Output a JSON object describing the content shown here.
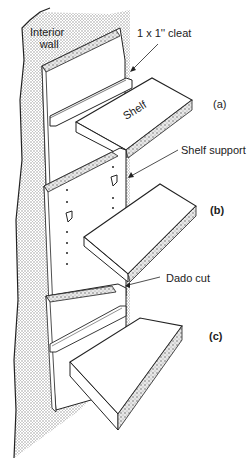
{
  "diagram": {
    "labels": {
      "interior_wall": [
        "Interior",
        "wall"
      ],
      "cleat": "1 x 1'' cleat",
      "shelf": "Shelf",
      "shelf_support": "Shelf support",
      "dado_cut": "Dado cut"
    },
    "variants": [
      {
        "id": "a",
        "label": "(a)",
        "method": "cleat"
      },
      {
        "id": "b",
        "label": "(b)",
        "method": "shelf support pins"
      },
      {
        "id": "c",
        "label": "(c)",
        "method": "dado cut"
      }
    ],
    "colors": {
      "stroke": "#222222",
      "wall_fill": "#d9d9d9",
      "surface": "#ffffff"
    }
  }
}
